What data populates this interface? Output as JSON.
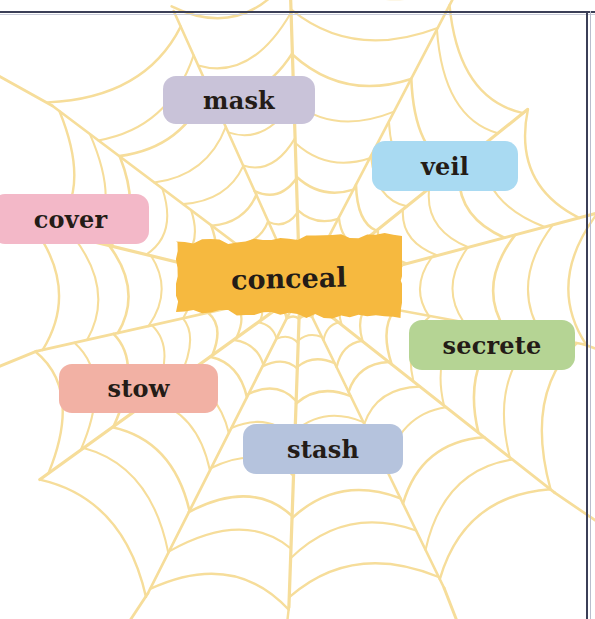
{
  "figure": {
    "kind": "word-web-diagram",
    "background_color": "#ffffff",
    "web_color": "#f6dd9a",
    "frame_color": "#3b3f57",
    "text_color": "#241c17"
  },
  "center": {
    "label": "conceal",
    "color": "#f6b93f",
    "style": "torn-paper",
    "x": 176,
    "y": 233,
    "width": 226,
    "height": 90,
    "font_size": 27
  },
  "nodes": [
    {
      "label": "mask",
      "color": "#c9c3d9",
      "x": 163,
      "y": 76,
      "width": 152,
      "height": 48,
      "font_size": 24
    },
    {
      "label": "veil",
      "color": "#a9daf2",
      "x": 372,
      "y": 141,
      "width": 146,
      "height": 50,
      "font_size": 24
    },
    {
      "label": "cover",
      "color": "#f3b8c8",
      "x": -8,
      "y": 194,
      "width": 157,
      "height": 50,
      "font_size": 24
    },
    {
      "label": "secrete",
      "color": "#b5d494",
      "x": 409,
      "y": 320,
      "width": 166,
      "height": 50,
      "font_size": 24
    },
    {
      "label": "stow",
      "color": "#f2b1a4",
      "x": 59,
      "y": 364,
      "width": 159,
      "height": 49,
      "font_size": 24
    },
    {
      "label": "stash",
      "color": "#b5c3dd",
      "x": 243,
      "y": 424,
      "width": 160,
      "height": 50,
      "font_size": 24
    }
  ],
  "chart_data": {
    "type": "diagram",
    "title": "conceal",
    "subtype": "spider-web word map",
    "center_word": "conceal",
    "related_words": [
      "mask",
      "veil",
      "cover",
      "secrete",
      "stow",
      "stash"
    ],
    "node_colors": {
      "conceal": "#f6b93f",
      "mask": "#c9c3d9",
      "veil": "#a9daf2",
      "cover": "#f3b8c8",
      "secrete": "#b5d494",
      "stow": "#f2b1a4",
      "stash": "#b5c3dd"
    },
    "web": {
      "center_x": 300,
      "center_y": 292,
      "radial_spokes": 14,
      "concentric_rings": 9,
      "stroke_color": "#f6dd9a"
    }
  }
}
